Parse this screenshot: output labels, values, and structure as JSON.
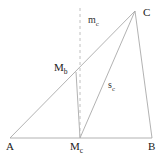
{
  "figure": {
    "canvas": {
      "width": 164,
      "height": 161
    },
    "colors": {
      "background": "#ffffff",
      "stroke": "#a9a9a9",
      "dashed_stroke": "#b9b9b9",
      "label_text": "#1a1a1a",
      "segment_label_text": "#333333"
    },
    "stroke_width": 0.9,
    "dash_pattern": "3,3"
  },
  "points": [
    {
      "id": "A",
      "label": "A",
      "sub": "",
      "x": 10,
      "y": 138,
      "label_x": 6,
      "label_y": 141
    },
    {
      "id": "B",
      "label": "B",
      "sub": "",
      "x": 152,
      "y": 138,
      "label_x": 148,
      "label_y": 141
    },
    {
      "id": "C",
      "label": "C",
      "sub": "",
      "x": 135,
      "y": 11,
      "label_x": 143,
      "label_y": 7
    },
    {
      "id": "Mc",
      "label": "M",
      "sub": "c",
      "x": 80,
      "y": 138,
      "label_x": 70,
      "label_y": 141
    },
    {
      "id": "Mb",
      "label": "M",
      "sub": "b",
      "x": 76,
      "y": 72,
      "label_x": 54,
      "label_y": 62
    }
  ],
  "segments": [
    {
      "id": "AB",
      "from": "A",
      "to": "B",
      "style": "solid",
      "desc": "side-ab-baseline"
    },
    {
      "id": "AC",
      "from": "A",
      "to": "C",
      "style": "solid",
      "desc": "side-ac"
    },
    {
      "id": "BC",
      "from": "B",
      "to": "C",
      "style": "solid",
      "desc": "side-bc"
    },
    {
      "id": "McC",
      "from": "Mc",
      "to": "C",
      "style": "solid",
      "desc": "median-from-c-midpoint-to-c"
    },
    {
      "id": "McMb",
      "from": "Mc",
      "to": "Mb",
      "style": "solid",
      "desc": "midsegment-mc-to-mb"
    },
    {
      "id": "mc",
      "from": "Mc",
      "to": "top",
      "style": "dashed",
      "desc": "perpendicular-bisector-of-ab",
      "x": 80,
      "y1": 8,
      "y2": 138
    }
  ],
  "segment_labels": [
    {
      "id": "mc",
      "label": "m",
      "sub": "c",
      "x": 88,
      "y": 15
    },
    {
      "id": "sc",
      "label": "s",
      "sub": "c",
      "x": 108,
      "y": 80
    }
  ]
}
